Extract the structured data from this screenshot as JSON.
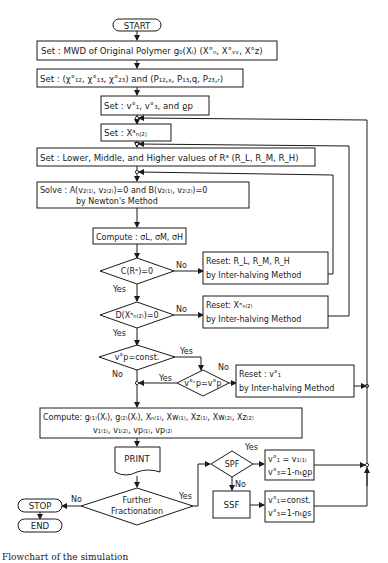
{
  "figure": {
    "caption": "Flowchart of the simulation",
    "terminals": {
      "start": "START",
      "stop": "STOP",
      "end": "END"
    },
    "steps": {
      "set_mwd": "Set : MWD of Original Polymer g₀(Xᵢ)  (X°ₙ, X°ᵥᵥ, X°z)",
      "set_chi": "Set : (χ°₁₂, χ°₁₃, χ°₂₃) and (P₁₂,ₛ, P₁₃,q, P₂₃,ᵣ)",
      "set_v": "Set : v°₁, v°₃, and ϱp",
      "set_xn": "Set :   Xᵃₙ₍₂₎",
      "set_r": "Set : Lower, Middle, and Higher values of Rᵃ (R_L, R_M, R_H)",
      "solve_line1": "Solve : A(v₂₍₁₎, v₂₍₂₎)=0 and B(v₂₍₁₎, v₂₍₂₎)=0",
      "solve_line2": "by Newton's Method",
      "compute_sigma": "Compute : σL, σM, σH",
      "reset_r_line1": "Reset: R_L, R_M, R_H",
      "reset_r_line2": "by Inter-halving Method",
      "reset_xn_line1": "Reset:   Xᵃₙ₍₂₎",
      "reset_xn_line2": "by Inter-halving Method",
      "reset_v1_line1": "Reset :   v°₁",
      "reset_v1_line2": "by Inter-halving Method",
      "compute_line1": "Compute: g₍₁₎(Xᵢ), g₍₂₎(Xᵢ), Xₙ₍₁₎, Xw₍₁₎, Xz₍₁₎, Xw₍₂₎, Xz₍₂₎",
      "compute_line2": "v₁₍₁₎, v₁₍₂₎, vp₍₁₎, vp₍₂₎",
      "print": "PRINT",
      "spf_line1": "v°₁ = v₁₍₁₎",
      "spf_line2": "v°₃=1-nₜϱp",
      "ssf_box": "SSF",
      "ssf_line1": "v°₁=const.",
      "ssf_line2": "v°₃=1-nₜϱs"
    },
    "decisions": {
      "c_ra": "C(Rᵃ)=0",
      "d_xn": "D(Xᵃₙ₍₂₎)=0",
      "vp_const": "v°p=const.",
      "vp_oc": "v°ᶜp=v°p",
      "further_line1": "Further",
      "further_line2": "Fractionation",
      "spf": "SPF"
    },
    "labels": {
      "yes": "Yes",
      "no": "No"
    }
  }
}
